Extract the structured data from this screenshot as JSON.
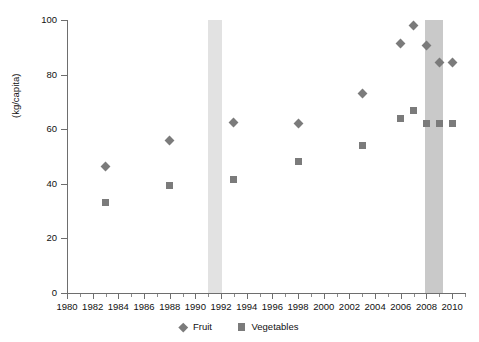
{
  "chart_data": {
    "type": "scatter",
    "title": "",
    "xlabel": "",
    "ylabel": "(kg/capita)",
    "xlim": [
      1980,
      2011
    ],
    "ylim": [
      0,
      100
    ],
    "grid": false,
    "legend_position": "bottom-center",
    "x_ticks": [
      1980,
      1982,
      1984,
      1986,
      1988,
      1990,
      1992,
      1994,
      1996,
      1998,
      2000,
      2002,
      2004,
      2006,
      2008,
      2010
    ],
    "x_tick_labels": [
      "1980",
      "1982",
      "1984",
      "1986",
      "1988",
      "1990",
      "1992",
      "1994",
      "1996",
      "1998",
      "2000",
      "2002",
      "2004",
      "2006",
      "2008",
      "2010"
    ],
    "x_minor_ticks": [
      1981,
      1983,
      1985,
      1987,
      1989,
      1991,
      1993,
      1995,
      1997,
      1999,
      2001,
      2003,
      2005,
      2007,
      2009,
      2011
    ],
    "y_ticks": [
      0,
      20,
      40,
      60,
      80,
      100
    ],
    "y_tick_labels": [
      "0",
      "20",
      "40",
      "60",
      "80",
      "100"
    ],
    "series": [
      {
        "name": "Fruit",
        "marker": "diamond",
        "color": "#7b7b7b",
        "points": [
          {
            "x": 1983,
            "y": 46.5
          },
          {
            "x": 1988,
            "y": 56.0
          },
          {
            "x": 1993,
            "y": 62.5
          },
          {
            "x": 1998,
            "y": 62.0
          },
          {
            "x": 2003,
            "y": 73.0
          },
          {
            "x": 2006,
            "y": 91.5
          },
          {
            "x": 2007,
            "y": 98.0
          },
          {
            "x": 2008,
            "y": 90.5
          },
          {
            "x": 2009,
            "y": 84.5
          },
          {
            "x": 2010,
            "y": 84.5
          }
        ]
      },
      {
        "name": "Vegetables",
        "marker": "square",
        "color": "#7b7b7b",
        "points": [
          {
            "x": 1983,
            "y": 33.0
          },
          {
            "x": 1988,
            "y": 39.5
          },
          {
            "x": 1993,
            "y": 41.5
          },
          {
            "x": 1998,
            "y": 48.0
          },
          {
            "x": 2003,
            "y": 54.0
          },
          {
            "x": 2006,
            "y": 64.0
          },
          {
            "x": 2007,
            "y": 67.0
          },
          {
            "x": 2008,
            "y": 62.0
          },
          {
            "x": 2009,
            "y": 62.0
          },
          {
            "x": 2010,
            "y": 62.0
          }
        ]
      }
    ],
    "shaded_bands": [
      {
        "x_start": 1991.0,
        "x_end": 1992.1,
        "color": "#e2e2e2"
      },
      {
        "x_start": 2007.9,
        "x_end": 2009.3,
        "color": "#c9c9c9"
      }
    ]
  },
  "legend": {
    "entries": [
      {
        "label": "Fruit",
        "marker": "diamond"
      },
      {
        "label": "Vegetables",
        "marker": "square"
      }
    ]
  },
  "axis": {
    "y_title": "(kg/capita)"
  }
}
